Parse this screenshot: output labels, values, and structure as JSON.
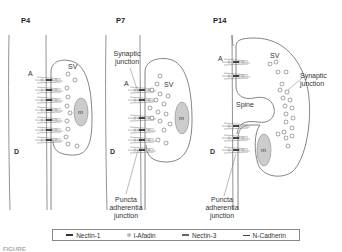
{
  "figure": {
    "panels": [
      {
        "stage": "P4",
        "labels": {
          "axon": "A",
          "dendrite": "D",
          "vesicles": "SV",
          "mitochondrion": "m"
        }
      },
      {
        "stage": "P7",
        "labels": {
          "axon": "A",
          "dendrite": "D",
          "vesicles": "SV",
          "mitochondrion": "m",
          "synaptic_junction": "Synaptic junction",
          "puncta": "Puncta adherentia junction"
        }
      },
      {
        "stage": "P14",
        "labels": {
          "axon": "A",
          "dendrite": "D",
          "vesicles": "SV",
          "mitochondrion": "m",
          "synaptic_junction": "Synaptic junction",
          "spine": "Spine",
          "puncta": "Puncta adherentia junction"
        }
      }
    ],
    "legend": [
      {
        "label": "Nectin-1",
        "swatch": "dark-bar"
      },
      {
        "label": "l-Afadin",
        "swatch": "gray-dot"
      },
      {
        "label": "Nectin-3",
        "swatch": "gray-bar"
      },
      {
        "label": "N-Cadherin",
        "swatch": "thin-bar"
      }
    ],
    "caption": "FIGURE"
  },
  "colors": {
    "outline": "#555555",
    "fill_gray": "#cccccc",
    "nectin1": "#222222",
    "afadin": "#b5b5b5"
  }
}
